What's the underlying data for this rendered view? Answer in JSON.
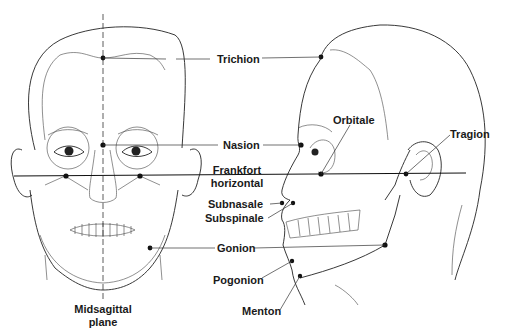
{
  "figure": {
    "views": [
      "frontal",
      "lateral"
    ],
    "colors": {
      "ink": "#222222",
      "background": "#ffffff"
    }
  },
  "labels": {
    "trichion": "Trichion",
    "nasion": "Nasion",
    "orbitale": "Orbitale",
    "tragion": "Tragion",
    "frankfort_line1": "Frankfort",
    "frankfort_line2": "horizontal",
    "subnasale": "Subnasale",
    "subspinale": "Subspinale",
    "gonion": "Gonion",
    "pogonion": "Pogonion",
    "menton": "Menton",
    "midsagittal_line1": "Midsagittal",
    "midsagittal_line2": "plane"
  }
}
